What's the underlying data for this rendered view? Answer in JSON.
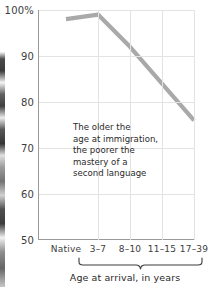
{
  "chart_data": {
    "type": "line",
    "title": "",
    "subtitle": "",
    "xlabel": "Age at arrival, in years",
    "ylabel": "",
    "categories": [
      "Native",
      "3–7",
      "8–10",
      "11–15",
      "17–39"
    ],
    "values": [
      98,
      99,
      92,
      84,
      76
    ],
    "ylim": [
      50,
      100
    ],
    "yticks": [
      50,
      60,
      70,
      80,
      90,
      100
    ],
    "ytick_labels": [
      "50",
      "60",
      "70",
      "80",
      "90",
      "100%"
    ],
    "grid": true,
    "legend": false,
    "series_color": "#a9a9a9",
    "gridline_color": "#e3e3e3",
    "axis_color": "#9a9a9a",
    "annotations": [
      {
        "text": "The older the\nage at immigration,\nthe poorer the\nmastery of a\nsecond language"
      }
    ],
    "brace_label": "Age at arrival, in years",
    "brace_spans": [
      "3–7",
      "17–39"
    ]
  },
  "yaxis": {
    "labels": [
      "100%",
      "90",
      "80",
      "70",
      "60",
      "50"
    ]
  },
  "xaxis": {
    "labels": [
      "Native",
      "3–7",
      "8–10",
      "11–15",
      "17–39"
    ],
    "title": "Age at arrival, in years"
  },
  "annotation": {
    "text": "The older the\nage at immigration,\nthe poorer the\nmastery of a\nsecond language"
  }
}
